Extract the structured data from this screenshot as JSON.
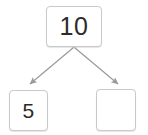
{
  "diagram": {
    "type": "number-bond",
    "accent_color": "#9a9a9a",
    "box_border_color": "#c9c9c9",
    "text_color": "#2b2b2b",
    "total": {
      "label": "total-box",
      "value": "10"
    },
    "parts": [
      {
        "label": "part-box-left",
        "value": "5",
        "empty": false
      },
      {
        "label": "part-box-right",
        "value": "",
        "empty": true
      }
    ],
    "connectors": [
      {
        "name": "arrow-to-left-part",
        "from": "total-box",
        "to": "part-box-left",
        "direction": "down-left"
      },
      {
        "name": "arrow-to-right-part",
        "from": "total-box",
        "to": "part-box-right",
        "direction": "down-right"
      }
    ]
  }
}
